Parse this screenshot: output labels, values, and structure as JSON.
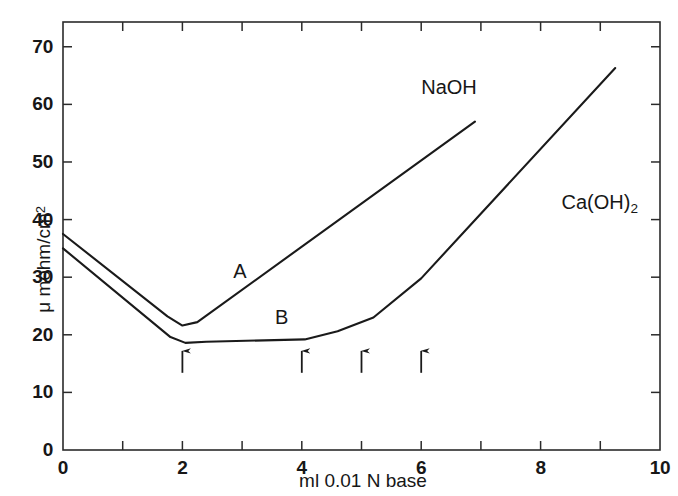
{
  "chart_data": {
    "type": "line",
    "title": "",
    "xlabel": "ml 0.01 N base",
    "ylabel": "μ mohm/cm²",
    "ylabel_parts": {
      "prefix": "μ mohm/cm",
      "superscript": "2"
    },
    "xlim": [
      0,
      10
    ],
    "ylim": [
      0,
      74.3
    ],
    "grid": false,
    "legend_position": "inline-annotations",
    "x_ticks_major": [
      0,
      2,
      4,
      6,
      8,
      10
    ],
    "x_ticks_minor": [
      1,
      3,
      5,
      7,
      9
    ],
    "x_tick_labels": [
      "0",
      "2",
      "4",
      "6",
      "8",
      "10"
    ],
    "y_ticks_major": [
      0,
      10,
      20,
      30,
      40,
      50,
      60,
      70
    ],
    "y_tick_labels": [
      "0",
      "10",
      "20",
      "30",
      "40",
      "50",
      "60",
      "70"
    ],
    "series": [
      {
        "name": "NaOH",
        "curve_tag": "A",
        "color": "#1a1a1a",
        "x": [
          0.0,
          1.75,
          2.0,
          2.25,
          6.9
        ],
        "values": [
          37.5,
          23.2,
          21.6,
          22.2,
          57.0
        ],
        "annotation": "NaOH",
        "annotation_x": 6.0,
        "annotation_y": 62.5,
        "tag_x": 2.85,
        "tag_y": 30.5
      },
      {
        "name": "Ca(OH)2",
        "curve_tag": "B",
        "color": "#1a1a1a",
        "x": [
          0.0,
          1.8,
          2.05,
          2.4,
          4.05,
          4.6,
          5.2,
          6.0,
          9.25
        ],
        "values": [
          35.0,
          19.6,
          18.6,
          18.8,
          19.2,
          20.6,
          23.0,
          29.8,
          66.3
        ],
        "annotation": "Ca(OH)",
        "annotation_subscript": "2",
        "annotation_x": 8.35,
        "annotation_y": 42.5,
        "tag_x": 3.55,
        "tag_y": 22.6
      }
    ],
    "arrows": {
      "direction": "up",
      "marker": "endpoint-arrow",
      "x_positions": [
        2,
        4,
        5,
        6
      ],
      "y_base": 13.4,
      "y_tip": 17.2
    },
    "axes_style": {
      "frame": "full-box",
      "line_color": "#2b2b2b",
      "background": "#ffffff"
    }
  }
}
